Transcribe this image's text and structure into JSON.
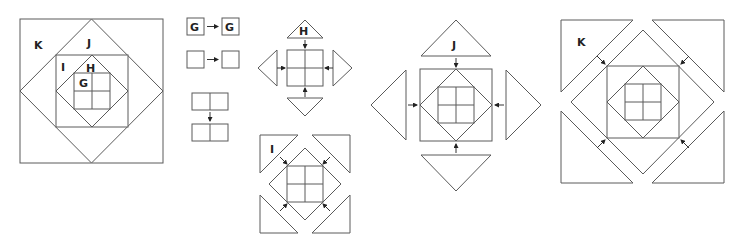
{
  "diagram": {
    "type": "quilt-block-assembly",
    "line_color": "#5a5a5a",
    "background": "#ffffff",
    "assembled_block": {
      "labels": {
        "k": "K",
        "j": "J",
        "i": "I",
        "h": "H",
        "g": "G"
      }
    },
    "step_four_patch": {
      "row1": {
        "left": "G",
        "right": "G"
      },
      "row2": {
        "left": "",
        "right": ""
      },
      "join": "two rows joined vertically"
    },
    "step_h": {
      "label": "H",
      "pieces": 4,
      "shape": "triangles on sides"
    },
    "step_i": {
      "label": "I",
      "pieces": 4,
      "shape": "corner triangles"
    },
    "step_j": {
      "label": "J",
      "pieces": 4,
      "shape": "triangles on sides"
    },
    "step_k": {
      "label": "K",
      "pieces": 4,
      "shape": "corner triangles"
    }
  }
}
